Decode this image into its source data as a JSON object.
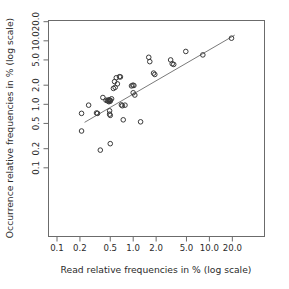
{
  "chart_data": {
    "type": "scatter",
    "title": "",
    "xlabel": "Read relative frequencies in % (log scale)",
    "ylabel": "Occurrence relative frequencies in % (log scale)",
    "xscale": "log",
    "yscale": "log",
    "xlim": [
      0.085,
      24.0
    ],
    "ylim": [
      0.085,
      24.0
    ],
    "grid": false,
    "legend": null,
    "xticks": [
      0.1,
      0.2,
      0.5,
      1.0,
      2.0,
      5.0,
      10.0,
      20.0
    ],
    "xticklabels": [
      "0.1",
      "0.2",
      "0.5",
      "1.0",
      "2.0",
      "5.0",
      "10.0",
      "20.0"
    ],
    "yticks": [
      0.1,
      0.2,
      0.5,
      1.0,
      2.0,
      5.0,
      10.0,
      20.0
    ],
    "yticklabels": [
      "0.1",
      "0.2",
      "0.5",
      "1.0",
      "2.0",
      "5.0",
      "10.0",
      "20.0"
    ],
    "marker": "open-circle",
    "marker_color": "#3a3a3a",
    "series": [
      {
        "name": "taxa",
        "points": [
          [
            0.21,
            0.72
          ],
          [
            0.21,
            0.38
          ],
          [
            0.26,
            0.97
          ],
          [
            0.33,
            0.73
          ],
          [
            0.34,
            0.72
          ],
          [
            0.37,
            0.19
          ],
          [
            0.4,
            1.28
          ],
          [
            0.44,
            1.16
          ],
          [
            0.46,
            1.14
          ],
          [
            0.47,
            1.13
          ],
          [
            0.48,
            1.18
          ],
          [
            0.48,
            1.1
          ],
          [
            0.49,
            1.15
          ],
          [
            0.49,
            0.79
          ],
          [
            0.49,
            0.7
          ],
          [
            0.5,
            1.16
          ],
          [
            0.5,
            1.12
          ],
          [
            0.5,
            0.67
          ],
          [
            0.5,
            0.24
          ],
          [
            0.52,
            1.22
          ],
          [
            0.55,
            1.78
          ],
          [
            0.57,
            2.28
          ],
          [
            0.58,
            1.85
          ],
          [
            0.6,
            2.62
          ],
          [
            0.62,
            2.1
          ],
          [
            0.66,
            2.72
          ],
          [
            0.68,
            2.7
          ],
          [
            0.7,
            0.98
          ],
          [
            0.72,
            0.95
          ],
          [
            0.74,
            0.57
          ],
          [
            0.78,
            0.97
          ],
          [
            0.95,
            1.95
          ],
          [
            0.99,
            2.0
          ],
          [
            1.0,
            1.52
          ],
          [
            1.02,
            1.98
          ],
          [
            1.05,
            1.4
          ],
          [
            1.25,
            0.53
          ],
          [
            1.6,
            5.5
          ],
          [
            1.65,
            4.7
          ],
          [
            1.85,
            3.1
          ],
          [
            1.92,
            2.95
          ],
          [
            3.1,
            5.0
          ],
          [
            3.25,
            4.35
          ],
          [
            3.4,
            4.25
          ],
          [
            4.9,
            6.8
          ],
          [
            8.2,
            6.0
          ],
          [
            19.5,
            11.0
          ]
        ]
      }
    ],
    "fit_line": {
      "type": "regression",
      "x_start": 0.23,
      "y_start": 0.52,
      "x_end": 21.5,
      "y_end": 12.3,
      "color": "#7a7a7a"
    }
  }
}
